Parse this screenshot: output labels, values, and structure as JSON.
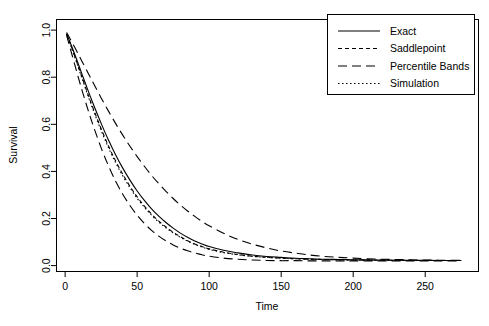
{
  "chart_data": {
    "type": "line",
    "title": "",
    "xlabel": "Time",
    "ylabel": "Survival",
    "xlim": [
      -6,
      287
    ],
    "ylim": [
      -0.025,
      1.045
    ],
    "xticks": [
      0,
      50,
      100,
      150,
      200,
      250
    ],
    "xtick_labels": [
      "0",
      "50",
      "100",
      "150",
      "200",
      "250"
    ],
    "yticks": [
      0.0,
      0.2,
      0.4,
      0.6,
      0.8,
      1.0
    ],
    "ytick_labels": [
      "0.0",
      "0.2",
      "0.4",
      "0.6",
      "0.8",
      "1.0"
    ],
    "grid": false,
    "legend_position": "top-right",
    "background": "#ffffff",
    "line_color": "#000000",
    "series": [
      {
        "name": "Exact",
        "linestyle": "solid",
        "dasharray": "none",
        "x": [
          1,
          4,
          8,
          12,
          16,
          20,
          25,
          30,
          35,
          40,
          45,
          50,
          55,
          60,
          65,
          70,
          75,
          80,
          85,
          90,
          95,
          100,
          110,
          120,
          130,
          140,
          150,
          160,
          170,
          180,
          190,
          200,
          215,
          230,
          245,
          260,
          275
        ],
        "y": [
          0.985,
          0.94,
          0.875,
          0.808,
          0.742,
          0.679,
          0.604,
          0.534,
          0.471,
          0.414,
          0.363,
          0.317,
          0.277,
          0.241,
          0.21,
          0.183,
          0.159,
          0.138,
          0.12,
          0.105,
          0.092,
          0.081,
          0.065,
          0.054,
          0.045,
          0.039,
          0.035,
          0.031,
          0.029,
          0.027,
          0.026,
          0.025,
          0.024,
          0.023,
          0.023,
          0.022,
          0.022
        ]
      },
      {
        "name": "Saddlepoint",
        "linestyle": "dashed",
        "dasharray": "4,3",
        "x": [
          1,
          4,
          8,
          12,
          16,
          20,
          25,
          30,
          35,
          40,
          45,
          50,
          55,
          60,
          65,
          70,
          75,
          80,
          85,
          90,
          95,
          100,
          110,
          120,
          130,
          140,
          150,
          160,
          170,
          180,
          190,
          200,
          215,
          230,
          245,
          260,
          275
        ],
        "y": [
          0.984,
          0.935,
          0.866,
          0.795,
          0.725,
          0.659,
          0.581,
          0.509,
          0.445,
          0.388,
          0.337,
          0.292,
          0.253,
          0.219,
          0.189,
          0.164,
          0.142,
          0.123,
          0.106,
          0.092,
          0.081,
          0.071,
          0.057,
          0.047,
          0.04,
          0.035,
          0.032,
          0.029,
          0.027,
          0.026,
          0.025,
          0.024,
          0.023,
          0.023,
          0.022,
          0.022,
          0.022
        ]
      },
      {
        "name": "Percentile Bands",
        "series_role": "lower-band",
        "linestyle": "longdash",
        "dasharray": "9,5",
        "x": [
          1,
          4,
          8,
          12,
          16,
          20,
          25,
          30,
          35,
          40,
          45,
          50,
          55,
          60,
          65,
          70,
          75,
          80,
          85,
          90,
          95,
          100,
          110,
          120,
          130,
          140,
          150,
          160,
          170,
          180,
          190,
          200,
          215,
          230,
          245,
          260,
          275
        ],
        "y": [
          0.978,
          0.912,
          0.824,
          0.739,
          0.659,
          0.585,
          0.5,
          0.425,
          0.359,
          0.303,
          0.255,
          0.214,
          0.179,
          0.15,
          0.125,
          0.105,
          0.088,
          0.074,
          0.063,
          0.054,
          0.046,
          0.04,
          0.032,
          0.027,
          0.024,
          0.022,
          0.021,
          0.021,
          0.02,
          0.02,
          0.02,
          0.02,
          0.02,
          0.02,
          0.02,
          0.02,
          0.02
        ]
      },
      {
        "name": "Percentile Bands",
        "series_role": "upper-band",
        "linestyle": "longdash",
        "dasharray": "9,5",
        "x": [
          1,
          4,
          8,
          12,
          16,
          20,
          25,
          30,
          35,
          40,
          45,
          50,
          55,
          60,
          65,
          70,
          75,
          80,
          85,
          90,
          95,
          100,
          110,
          120,
          130,
          140,
          150,
          160,
          170,
          180,
          190,
          200,
          215,
          230,
          245,
          260,
          275
        ],
        "y": [
          0.99,
          0.957,
          0.911,
          0.864,
          0.817,
          0.77,
          0.712,
          0.657,
          0.604,
          0.554,
          0.507,
          0.463,
          0.422,
          0.383,
          0.348,
          0.315,
          0.285,
          0.257,
          0.232,
          0.209,
          0.188,
          0.169,
          0.137,
          0.111,
          0.091,
          0.075,
          0.062,
          0.053,
          0.045,
          0.039,
          0.035,
          0.032,
          0.028,
          0.026,
          0.024,
          0.023,
          0.022
        ]
      },
      {
        "name": "Simulation",
        "linestyle": "dotted",
        "dasharray": "1.5,2.5",
        "x": [
          1,
          4,
          8,
          12,
          16,
          20,
          25,
          30,
          35,
          40,
          45,
          50,
          55,
          60,
          65,
          70,
          75,
          80,
          85,
          90,
          95,
          100,
          110,
          120,
          130,
          140,
          150,
          160,
          170,
          180,
          190,
          200,
          215,
          230,
          245,
          260,
          275
        ],
        "y": [
          0.983,
          0.932,
          0.862,
          0.79,
          0.719,
          0.652,
          0.574,
          0.502,
          0.438,
          0.381,
          0.331,
          0.286,
          0.248,
          0.214,
          0.185,
          0.16,
          0.139,
          0.12,
          0.104,
          0.09,
          0.079,
          0.069,
          0.055,
          0.046,
          0.039,
          0.035,
          0.031,
          0.029,
          0.027,
          0.026,
          0.025,
          0.024,
          0.023,
          0.022,
          0.022,
          0.022,
          0.022
        ]
      }
    ],
    "legend_entries": [
      {
        "label": "Exact",
        "dasharray": "none"
      },
      {
        "label": "Saddlepoint",
        "dasharray": "4,3"
      },
      {
        "label": "Percentile Bands",
        "dasharray": "9,5"
      },
      {
        "label": "Simulation",
        "dasharray": "1.5,2.5"
      }
    ]
  }
}
